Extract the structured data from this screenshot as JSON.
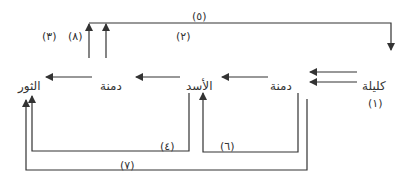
{
  "nodes": {
    "kalila": "كليلة",
    "dimna_right": "دمنة",
    "asad": "الأسد",
    "dimna_left": "دمنة",
    "thawr": "الثور"
  },
  "labels": {
    "n1": "(١)",
    "n2": "(٢)",
    "n3": "(٣)",
    "n4": "(٤)",
    "n5": "(٥)",
    "n6": "(٦)",
    "n7": "(٧)",
    "n8": "(٨)"
  },
  "colors": {
    "line": "#333333",
    "text": "#333333",
    "background": "#ffffff"
  }
}
